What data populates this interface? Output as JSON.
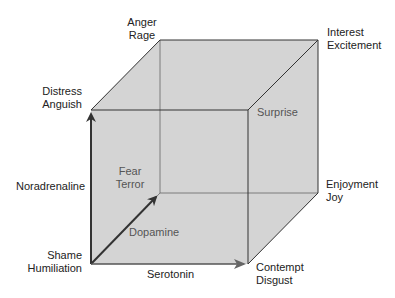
{
  "diagram": {
    "colors": {
      "face_fill": "#d4d4d4",
      "edge": "#333333",
      "inner_edge": "#555555",
      "text": "#222222",
      "inner_text": "#555555"
    },
    "corners": {
      "distress": {
        "line1": "Distress",
        "line2": "Anguish"
      },
      "anger": {
        "line1": "Anger",
        "line2": "Rage"
      },
      "interest": {
        "line1": "Interest",
        "line2": "Excitement"
      },
      "surprise": {
        "line1": "Surprise"
      },
      "fear": {
        "line1": "Fear",
        "line2": "Terror"
      },
      "enjoyment": {
        "line1": "Enjoyment",
        "line2": "Joy"
      },
      "shame": {
        "line1": "Shame",
        "line2": "Humiliation"
      },
      "contempt": {
        "line1": "Contempt",
        "line2": "Disgust"
      }
    },
    "axes": {
      "noradrenaline": "Noradrenaline",
      "dopamine": "Dopamine",
      "serotonin": "Serotonin"
    }
  }
}
